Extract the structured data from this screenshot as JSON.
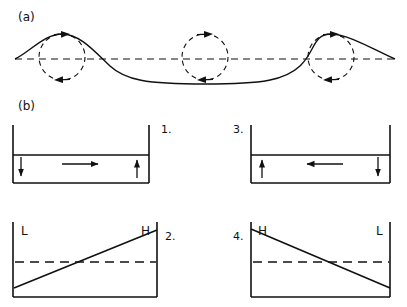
{
  "figure": {
    "background_color": "#ffffff",
    "stroke_color": "#111111",
    "width": 407,
    "height": 307
  },
  "panel_a": {
    "label": "(a)",
    "description": "Sinusoidal wave profile with dashed orbital circles and motion arrows",
    "baseline_label": "still-water-level",
    "wave": {
      "baseline_y": 59,
      "amplitude": 25,
      "x_start": 15,
      "x_end": 395,
      "crest_x": [
        62,
        331
      ],
      "trough_x": [
        205
      ]
    },
    "orbits": [
      {
        "id": "orbit-crest-left",
        "cx": 62,
        "cy": 57,
        "r": 23,
        "top_arrow_direction": "right",
        "bottom_arrow_direction": "left",
        "sense": "clockwise"
      },
      {
        "id": "orbit-trough-mid",
        "cx": 205,
        "cy": 57,
        "r": 23,
        "top_arrow_direction": "right",
        "bottom_arrow_direction": "left",
        "sense": "clockwise"
      },
      {
        "id": "orbit-crest-right",
        "cx": 331,
        "cy": 57,
        "r": 23,
        "top_arrow_direction": "right",
        "bottom_arrow_direction": "left",
        "sense": "clockwise"
      }
    ]
  },
  "panel_b": {
    "label": "(b)",
    "boxes": [
      {
        "id": "box-1",
        "number": "1.",
        "type": "current",
        "x": 13,
        "y": 125,
        "w": 136,
        "h": 58,
        "interface_y": 155,
        "left_arrow": "down",
        "right_arrow": "up",
        "flow_arrow": "right",
        "corner_labels": {
          "left": "",
          "right": ""
        }
      },
      {
        "id": "box-3",
        "number": "3.",
        "type": "current",
        "x": 251,
        "y": 125,
        "w": 139,
        "h": 58,
        "interface_y": 155,
        "left_arrow": "up",
        "right_arrow": "down",
        "flow_arrow": "left",
        "corner_labels": {
          "left": "",
          "right": ""
        }
      },
      {
        "id": "box-2",
        "number": "2.",
        "type": "elevation",
        "x": 13,
        "y": 222,
        "w": 144,
        "h": 75,
        "dashed_y": 262,
        "slope": "rising",
        "corner_labels": {
          "left": "L",
          "right": "H"
        }
      },
      {
        "id": "box-4",
        "number": "4.",
        "type": "elevation",
        "x": 251,
        "y": 222,
        "w": 139,
        "h": 75,
        "dashed_y": 262,
        "slope": "falling",
        "corner_labels": {
          "left": "H",
          "right": "L"
        }
      }
    ],
    "legend_terms": {
      "high": "H",
      "low": "L"
    }
  }
}
